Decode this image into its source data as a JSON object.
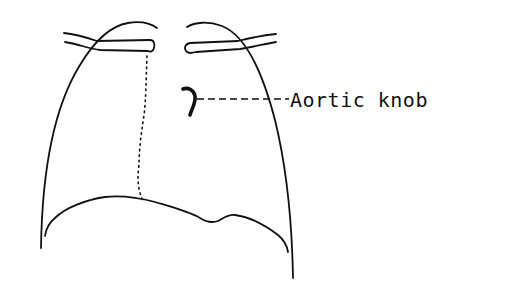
{
  "diagram": {
    "labels": [
      {
        "id": "aortic-knob",
        "text": "Aortic knob"
      }
    ],
    "colors": {
      "line": "#111111",
      "background": "#ffffff"
    }
  }
}
